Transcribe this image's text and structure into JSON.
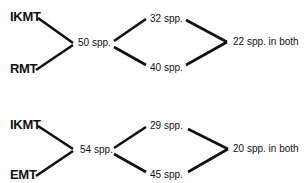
{
  "diagrams": [
    {
      "sources": [
        "IKMT",
        "RMT"
      ],
      "combined": "50 spp.",
      "branches": [
        "32 spp.",
        "40 spp."
      ],
      "overlap": "22 spp. in both"
    },
    {
      "sources": [
        "IKMT",
        "EMT"
      ],
      "combined": "54 spp.",
      "branches": [
        "29 spp.",
        "45 spp."
      ],
      "overlap": "20 spp. in both"
    }
  ]
}
